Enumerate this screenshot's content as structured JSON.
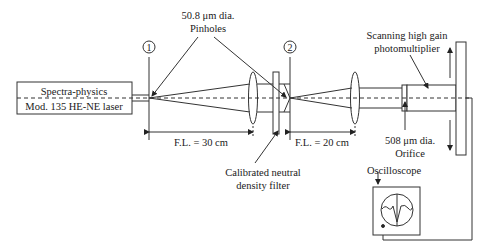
{
  "diagram": {
    "type": "optical-setup",
    "colors": {
      "stroke": "#333333",
      "text": "#1a1a1a",
      "background": "#ffffff"
    },
    "laser": {
      "line1": "Spectra-physics",
      "line2": "Mod. 135 HE-NE laser"
    },
    "pinholes": {
      "label_line1": "50.8 μm dia.",
      "label_line2": "Pinholes",
      "marker1": "1",
      "marker2": "2"
    },
    "focal_lengths": {
      "first": "F.L. = 30 cm",
      "second": "F.L. = 20 cm"
    },
    "filter": {
      "line1": "Calibrated neutral",
      "line2": "density filter"
    },
    "photomultiplier": {
      "line1": "Scanning high gain",
      "line2": "photomultiplier"
    },
    "orifice": {
      "line1": "508 μm dia.",
      "line2": "Orifice"
    },
    "oscilloscope": {
      "label": "Oscilloscope"
    }
  }
}
